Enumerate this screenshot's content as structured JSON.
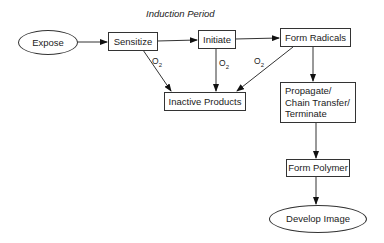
{
  "diagram": {
    "title": "Induction Period",
    "nodes": {
      "expose": "Expose",
      "sensitize": "Sensitize",
      "initiate": "Initiate",
      "form_radicals": "Form Radicals",
      "inactive_products": "Inactive Products",
      "propagate": [
        "Propagate/",
        "Chain Transfer/",
        "Terminate"
      ],
      "form_polymer": "Form Polymer",
      "develop_image": "Develop Image"
    },
    "edge_labels": {
      "o2_base": "O",
      "o2_sub": "2"
    },
    "edges": [
      {
        "from": "Expose",
        "to": "Sensitize"
      },
      {
        "from": "Sensitize",
        "to": "Initiate"
      },
      {
        "from": "Initiate",
        "to": "Form Radicals"
      },
      {
        "from": "Sensitize",
        "to": "Inactive Products",
        "label": "O2"
      },
      {
        "from": "Initiate",
        "to": "Inactive Products",
        "label": "O2"
      },
      {
        "from": "Form Radicals",
        "to": "Inactive Products",
        "label": "O2"
      },
      {
        "from": "Form Radicals",
        "to": "Propagate/Chain Transfer/Terminate"
      },
      {
        "from": "Propagate/Chain Transfer/Terminate",
        "to": "Form Polymer"
      },
      {
        "from": "Form Polymer",
        "to": "Develop Image"
      }
    ]
  }
}
